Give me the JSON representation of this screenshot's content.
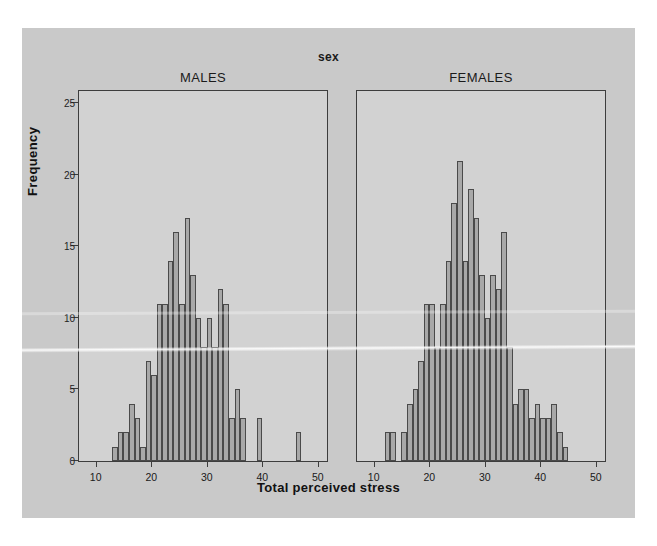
{
  "chart_data": {
    "type": "bar",
    "title": "sex",
    "xlabel": "Total perceived stress",
    "ylabel": "Frequency",
    "ylim": [
      0,
      26
    ],
    "xlim": [
      7,
      52
    ],
    "yticks": [
      0,
      5,
      10,
      15,
      20,
      25
    ],
    "xticks": [
      10,
      20,
      30,
      40,
      50
    ],
    "grid": false,
    "legend": "none",
    "bin_width": 1,
    "panels": [
      {
        "label": "MALES",
        "x": [
          13,
          14,
          15,
          16,
          17,
          18,
          19,
          20,
          21,
          22,
          23,
          24,
          25,
          26,
          27,
          28,
          29,
          30,
          31,
          32,
          33,
          34,
          35,
          36,
          39,
          46
        ],
        "values": [
          1,
          2,
          2,
          4,
          3,
          1,
          7,
          6,
          11,
          11,
          14,
          16,
          11,
          17,
          13,
          10,
          8,
          10,
          8,
          12,
          11,
          3,
          5,
          3,
          3,
          2,
          1
        ]
      },
      {
        "label": "FEMALES",
        "x": [
          12,
          13,
          15,
          16,
          17,
          18,
          19,
          20,
          21,
          22,
          23,
          24,
          25,
          26,
          27,
          28,
          29,
          30,
          31,
          32,
          33,
          34,
          35,
          36,
          37,
          38,
          39,
          40,
          41,
          42,
          43,
          44
        ],
        "values": [
          2,
          2,
          2,
          4,
          5,
          7,
          11,
          11,
          8,
          11,
          14,
          18,
          21,
          14,
          19,
          17,
          13,
          10,
          13,
          12,
          16,
          8,
          4,
          5,
          5,
          3,
          4,
          3,
          3,
          4,
          2,
          1
        ]
      }
    ]
  },
  "figure": {
    "title": "sex",
    "xlabel": "Total perceived stress",
    "ylabel": "Frequency"
  },
  "colors": {
    "figure_background": "#c9c9c9",
    "panel_background": "#d2d2d2",
    "bar_fill": "#a8a8a8",
    "bar_stroke": "#4a4a4a",
    "axis": "#3d3d3d",
    "text": "#1a1a1a"
  }
}
